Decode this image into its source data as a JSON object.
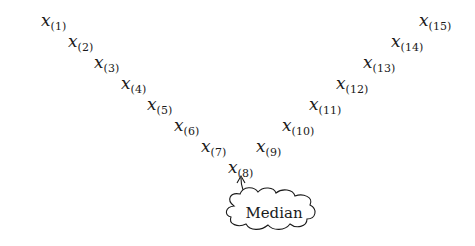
{
  "diagram": {
    "nodes": [
      {
        "var": "x",
        "sub": "(1)",
        "x": 41,
        "y": 10
      },
      {
        "var": "x",
        "sub": "(2)",
        "x": 68,
        "y": 31
      },
      {
        "var": "x",
        "sub": "(3)",
        "x": 94,
        "y": 52
      },
      {
        "var": "x",
        "sub": "(4)",
        "x": 121,
        "y": 73
      },
      {
        "var": "x",
        "sub": "(5)",
        "x": 147,
        "y": 94
      },
      {
        "var": "x",
        "sub": "(6)",
        "x": 174,
        "y": 115
      },
      {
        "var": "x",
        "sub": "(7)",
        "x": 201,
        "y": 136
      },
      {
        "var": "x",
        "sub": "(8)",
        "x": 228,
        "y": 157
      },
      {
        "var": "x",
        "sub": "(9)",
        "x": 256,
        "y": 136
      },
      {
        "var": "x",
        "sub": "(10)",
        "x": 282,
        "y": 115
      },
      {
        "var": "x",
        "sub": "(11)",
        "x": 309,
        "y": 94
      },
      {
        "var": "x",
        "sub": "(12)",
        "x": 336,
        "y": 73
      },
      {
        "var": "x",
        "sub": "(13)",
        "x": 363,
        "y": 52
      },
      {
        "var": "x",
        "sub": "(14)",
        "x": 391,
        "y": 31
      },
      {
        "var": "x",
        "sub": "(15)",
        "x": 419,
        "y": 10
      }
    ],
    "callout": {
      "label": "Median",
      "points_to": "x(8)"
    }
  }
}
